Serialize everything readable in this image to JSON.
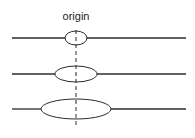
{
  "diagram": {
    "label": "origin",
    "colors": {
      "stroke": "#2b2b2b",
      "background": "#ffffff"
    },
    "axis": {
      "x": 76,
      "y1": 30,
      "y2": 128,
      "style": "dashed"
    },
    "rows": [
      {
        "y": 38,
        "ellipse": {
          "cx": 76,
          "rx": 11,
          "ry": 7
        },
        "line": {
          "x1": 12,
          "x2": 186
        }
      },
      {
        "y": 74,
        "ellipse": {
          "cx": 76,
          "rx": 21,
          "ry": 8
        },
        "line": {
          "x1": 12,
          "x2": 186
        }
      },
      {
        "y": 109,
        "ellipse": {
          "cx": 76,
          "rx": 35,
          "ry": 10
        },
        "line": {
          "x1": 12,
          "x2": 186
        }
      }
    ]
  }
}
